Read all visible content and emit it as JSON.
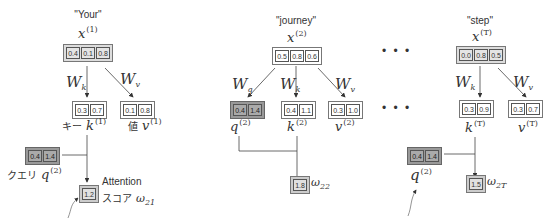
{
  "columns": [
    {
      "word": "\"Your\"",
      "x_label": "x",
      "x_sup": "(1)",
      "x_vec": [
        "0.4",
        "0.1",
        "0.8"
      ],
      "wk": "W",
      "wk_sub": "k",
      "wv": "W",
      "wv_sub": "v",
      "k_vec": [
        "0.3",
        "0.7"
      ],
      "v_vec": [
        "0.1",
        "0.8"
      ],
      "k_prefix": "キー",
      "k_label": "k",
      "k_sup": "(1)",
      "v_prefix": "値",
      "v_label": "v",
      "v_sup": "(1)",
      "q_vec": [
        "0.4",
        "1.4"
      ],
      "q_prefix": "クエリ",
      "q_label": "q",
      "q_sup": "(2)",
      "score": "1.2",
      "score_text_1": "Attention",
      "score_text_2": "スコア",
      "omega": "ω",
      "omega_sub": "21"
    },
    {
      "word": "\"journey\"",
      "x_label": "x",
      "x_sup": "(2)",
      "x_vec": [
        "0.5",
        "0.8",
        "0.6"
      ],
      "wq": "W",
      "wq_sub": "q",
      "wk": "W",
      "wk_sub": "k",
      "wv": "W",
      "wv_sub": "v",
      "q_vec": [
        "0.4",
        "1.4"
      ],
      "k_vec": [
        "0.4",
        "1.1"
      ],
      "v_vec": [
        "0.3",
        "1.0"
      ],
      "q_label": "q",
      "q_sup": "(2)",
      "k_label": "k",
      "k_sup": "(2)",
      "v_label": "v",
      "v_sup": "(2)",
      "score": "1.8",
      "omega": "ω",
      "omega_sub": "22"
    },
    {
      "word": "\"step\"",
      "x_label": "x",
      "x_sup": "(T)",
      "x_vec": [
        "0.0",
        "0.8",
        "0.5"
      ],
      "wk": "W",
      "wk_sub": "k",
      "wv": "W",
      "wv_sub": "v",
      "k_vec": [
        "0.3",
        "0.9"
      ],
      "v_vec": [
        "0.3",
        "0.7"
      ],
      "k_label": "k",
      "k_sup": "(T)",
      "v_label": "v",
      "v_sup": "(T)",
      "q_vec": [
        "0.4",
        "1.4"
      ],
      "q_label": "q",
      "q_sup": "(2)",
      "score": "1.5",
      "omega": "ω",
      "omega_sub": "2T"
    }
  ],
  "ellipsis": "• • •"
}
